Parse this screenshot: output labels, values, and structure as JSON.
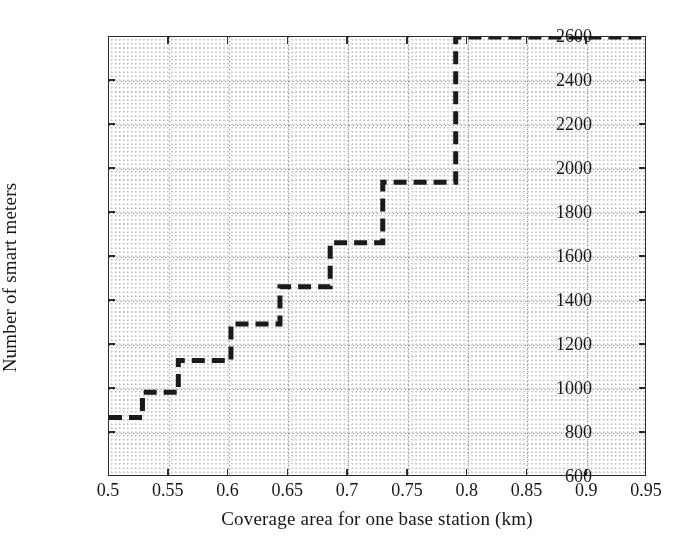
{
  "chart_data": {
    "type": "line",
    "subtype": "step",
    "title": "",
    "xlabel": "Coverage area for one base station (km)",
    "ylabel": "Number of smart meters",
    "xlim": [
      0.5,
      0.95
    ],
    "ylim": [
      600,
      2600
    ],
    "xticks": [
      0.5,
      0.55,
      0.6,
      0.65,
      0.7,
      0.75,
      0.8,
      0.85,
      0.9,
      0.95
    ],
    "xtick_labels": [
      "0.5",
      "0.55",
      "0.6",
      "0.65",
      "0.7",
      "0.75",
      "0.8",
      "0.85",
      "0.9",
      "0.95"
    ],
    "yticks": [
      600,
      800,
      1000,
      1200,
      1400,
      1600,
      1800,
      2000,
      2200,
      2400,
      2600
    ],
    "ytick_labels": [
      "600",
      "800",
      "1000",
      "1200",
      "1400",
      "1600",
      "1800",
      "2000",
      "2200",
      "2400",
      "2600"
    ],
    "grid": true,
    "grid_style": "dotted",
    "legend": null,
    "line_style": "dashed",
    "line_color": "#1a1a1a",
    "line_width": 5,
    "steps": [
      {
        "x_start": 0.5,
        "x_end": 0.528,
        "y": 870
      },
      {
        "x_start": 0.528,
        "x_end": 0.558,
        "y": 985
      },
      {
        "x_start": 0.558,
        "x_end": 0.602,
        "y": 1130
      },
      {
        "x_start": 0.602,
        "x_end": 0.643,
        "y": 1295
      },
      {
        "x_start": 0.643,
        "x_end": 0.685,
        "y": 1465
      },
      {
        "x_start": 0.685,
        "x_end": 0.729,
        "y": 1665
      },
      {
        "x_start": 0.729,
        "x_end": 0.79,
        "y": 1940
      },
      {
        "x_start": 0.79,
        "x_end": 0.95,
        "y": 2600
      }
    ],
    "series": [
      {
        "name": "Number of smart meters",
        "x": [
          0.5,
          0.528,
          0.558,
          0.602,
          0.643,
          0.685,
          0.729,
          0.79,
          0.95
        ],
        "values": [
          870,
          985,
          1130,
          1295,
          1465,
          1665,
          1940,
          2600,
          2600
        ]
      }
    ]
  },
  "axes": {
    "x_title": "Coverage area for one base station (km)",
    "y_title": "Number of smart meters"
  },
  "style": {
    "background": "#ffffff",
    "frame_color": "#2b2b2b",
    "text_color": "#161616",
    "grid_color": "#6e6e6e",
    "data_color": "#1a1a1a"
  }
}
